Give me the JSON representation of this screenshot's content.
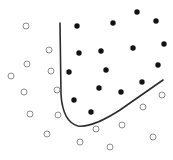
{
  "diagram": {
    "type": "classification-boundary-scatter",
    "colors": {
      "background": "#ffffff",
      "positive_fill": "#111111",
      "negative_stroke": "#8c8c8c",
      "boundary": "#2b2b2b"
    },
    "positive_points": [
      [
        77,
        26
      ],
      [
        113,
        23
      ],
      [
        137,
        12
      ],
      [
        156,
        21
      ],
      [
        79,
        53
      ],
      [
        101,
        51
      ],
      [
        133,
        48
      ],
      [
        164,
        44
      ],
      [
        69,
        72
      ],
      [
        106,
        70
      ],
      [
        158,
        65
      ],
      [
        99,
        88
      ],
      [
        121,
        92
      ],
      [
        142,
        82
      ],
      [
        74,
        100
      ],
      [
        91,
        112
      ]
    ],
    "negative_points": [
      [
        26,
        26
      ],
      [
        49,
        50
      ],
      [
        27,
        64
      ],
      [
        51,
        71
      ],
      [
        11,
        76
      ],
      [
        24,
        92
      ],
      [
        57,
        90
      ],
      [
        30,
        114
      ],
      [
        58,
        115
      ],
      [
        47,
        134
      ],
      [
        80,
        142
      ],
      [
        96,
        129
      ],
      [
        122,
        125
      ],
      [
        143,
        107
      ],
      [
        162,
        95
      ],
      [
        153,
        137
      ],
      [
        110,
        147
      ]
    ],
    "boundary_path": "M60,23 L61,95 Q63,122 78,126 Q92,128 120,110 L163,80"
  }
}
